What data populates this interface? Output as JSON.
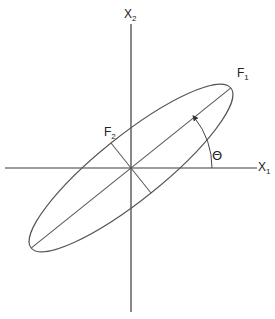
{
  "diagram": {
    "title": "",
    "labels": {
      "x1_axis": {
        "base": "X",
        "sub": "1"
      },
      "x2_axis": {
        "base": "X",
        "sub": "2"
      },
      "f1_axis": {
        "base": "F",
        "sub": "1"
      },
      "f2_axis": {
        "base": "F",
        "sub": "2"
      },
      "angle": "Θ"
    },
    "geometry": {
      "origin": [
        131,
        168
      ],
      "ellipse_semi_major": 128,
      "ellipse_semi_minor": 32,
      "rotation_deg": 38.7,
      "angle_arc_radius": 81
    },
    "colors": {
      "axes": "#3a3a3a",
      "ellipse": "#555555",
      "background": "#ffffff"
    }
  }
}
